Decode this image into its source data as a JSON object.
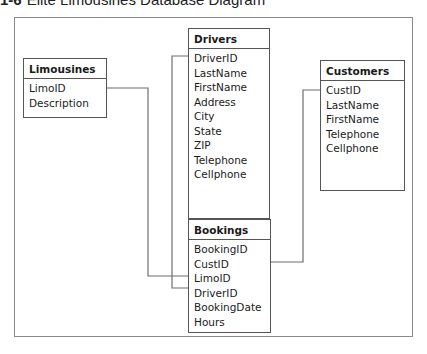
{
  "caption": {
    "figure_label": "1-6",
    "title": "Elite Limousines Database Diagram"
  },
  "tables": {
    "limousines": {
      "name": "Limousines",
      "fields": [
        "LimoID",
        "Description"
      ]
    },
    "drivers": {
      "name": "Drivers",
      "fields": [
        "DriverID",
        "LastName",
        "FirstName",
        "Address",
        "City",
        "State",
        "ZIP",
        "Telephone",
        "Cellphone"
      ]
    },
    "customers": {
      "name": "Customers",
      "fields": [
        "CustID",
        "LastName",
        "FirstName",
        "Telephone",
        "Cellphone"
      ]
    },
    "bookings": {
      "name": "Bookings",
      "fields": [
        "BookingID",
        "CustID",
        "LimoID",
        "DriverID",
        "BookingDate",
        "Hours"
      ]
    }
  },
  "relationships": [
    {
      "from": "Limousines.LimoID",
      "to": "Bookings.LimoID"
    },
    {
      "from": "Drivers.DriverID",
      "to": "Bookings.DriverID"
    },
    {
      "from": "Customers.CustID",
      "to": "Bookings.CustID"
    }
  ],
  "colors": {
    "line": "#6e6e6e",
    "border": "#555555",
    "frame": "#8a8a8a"
  }
}
